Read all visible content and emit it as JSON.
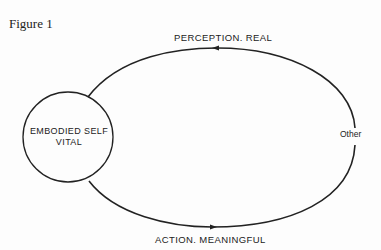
{
  "figure": {
    "caption": "Figure 1",
    "nodes": {
      "self_line1": "EMBODIED SELF",
      "self_line2": "VITAL",
      "other": "Other"
    },
    "edges": {
      "top": "PERCEPTION. REAL",
      "bottom": "ACTION. MEANINGFUL"
    },
    "colors": {
      "stroke": "#222222",
      "background": "#fdfdfd"
    }
  }
}
